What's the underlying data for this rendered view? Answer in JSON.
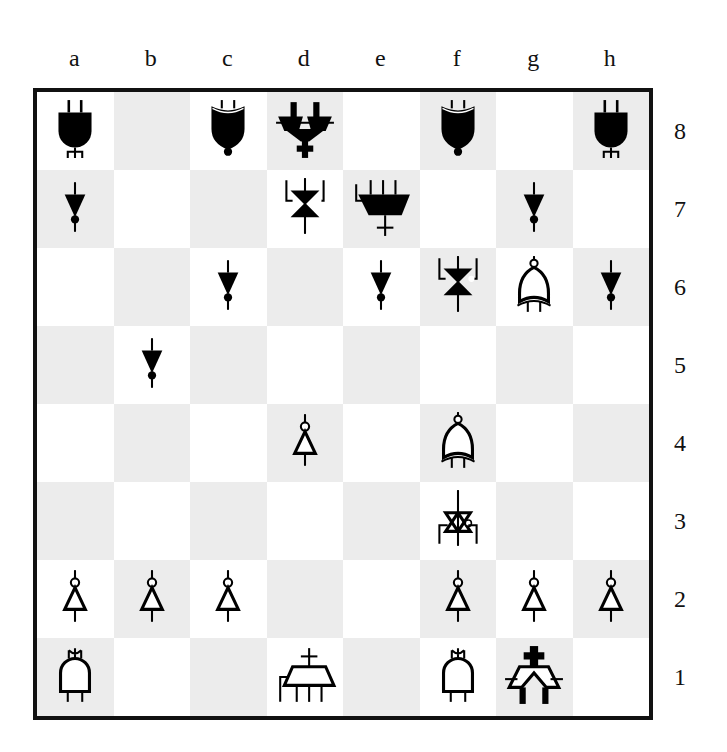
{
  "board": {
    "files": [
      "a",
      "b",
      "c",
      "d",
      "e",
      "f",
      "g",
      "h"
    ],
    "ranks": [
      "8",
      "7",
      "6",
      "5",
      "4",
      "3",
      "2",
      "1"
    ],
    "colors": {
      "light": "#ffffff",
      "dark": "#ececec",
      "border": "#111111",
      "piece_black": "#000000",
      "piece_white": "#ffffff"
    },
    "piece_style": "logic-gate glyphs",
    "position": [
      [
        "bR",
        "",
        "bB",
        "bQ",
        "",
        "bB",
        "",
        "bR"
      ],
      [
        "bP",
        "",
        "",
        "bK",
        "bQx",
        "",
        "bP",
        ""
      ],
      [
        "",
        "",
        "bP",
        "",
        "bP",
        "bK2",
        "wB",
        "bP"
      ],
      [
        "",
        "bP",
        "",
        "",
        "",
        "",
        "",
        ""
      ],
      [
        "",
        "",
        "",
        "wP",
        "",
        "wB",
        "",
        ""
      ],
      [
        "",
        "",
        "",
        "",
        "",
        "wK",
        "",
        ""
      ],
      [
        "wP",
        "wP",
        "wP",
        "",
        "",
        "wP",
        "wP",
        "wP"
      ],
      [
        "wR",
        "",
        "",
        "wQ",
        "",
        "wR",
        "wQ2",
        ""
      ]
    ],
    "piece_names": {
      "bR": "black-rook-and-gate",
      "bB": "black-bishop-or-gate",
      "bQ": "black-queen-gate",
      "bK": "black-king-transmission-gate",
      "bQx": "black-mux-gate",
      "bK2": "black-transmission-gate",
      "bP": "black-pawn-buffer-gate",
      "wP": "white-pawn-buffer-gate",
      "wB": "white-bishop-or-gate",
      "wK": "white-king-transmission-gate",
      "wR": "white-rook-and-gate",
      "wQ": "white-mux-gate",
      "wQ2": "white-queen-gate"
    }
  }
}
